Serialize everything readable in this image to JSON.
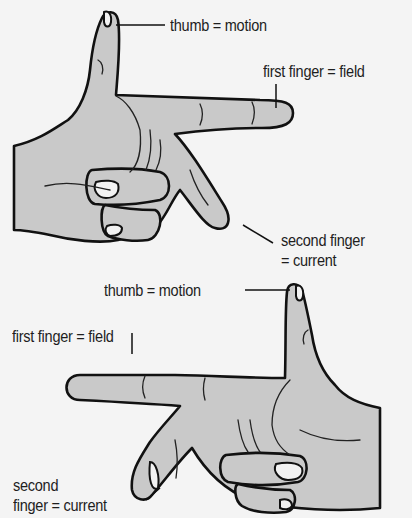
{
  "figure": {
    "top_hand": {
      "labels": {
        "thumb": "thumb = motion",
        "first_finger": "first finger = field",
        "second_finger_line1": "second finger",
        "second_finger_line2": "= current"
      }
    },
    "bottom_hand": {
      "labels": {
        "thumb": "thumb = motion",
        "first_finger": "first finger = field",
        "second_finger_line1": "second",
        "second_finger_line2": "finger = current"
      }
    },
    "colors": {
      "background": "#f4f4f4",
      "skin_fill": "#c9c9c9",
      "outline": "#111111"
    }
  }
}
